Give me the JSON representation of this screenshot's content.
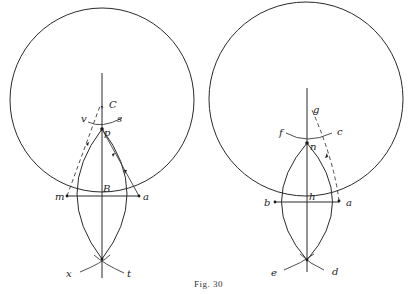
{
  "caption": "Fig. 30",
  "left_figure": {
    "labels": {
      "C": "C",
      "v": "v",
      "s": "s",
      "p": "p",
      "B": "B",
      "m": "m",
      "a": "a",
      "x": "x",
      "t": "t"
    }
  },
  "right_figure": {
    "labels": {
      "g": "g",
      "f": "f",
      "c": "c",
      "n": "n",
      "h": "h",
      "b": "b",
      "a": "a",
      "e": "e",
      "d": "d"
    }
  }
}
